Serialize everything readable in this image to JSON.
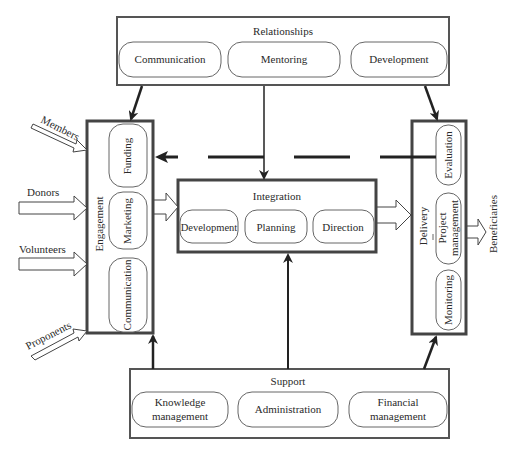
{
  "diagram": {
    "relationships": {
      "title": "Relationships",
      "items": [
        "Communication",
        "Mentoring",
        "Development"
      ]
    },
    "engagement": {
      "title": "Engagement",
      "items": [
        "Funding",
        "Marketing",
        "Communication"
      ]
    },
    "integration": {
      "title": "Integration",
      "items": [
        "Development",
        "Planning",
        "Direction"
      ]
    },
    "delivery": {
      "title": "Delivery",
      "items": [
        "Evaluation",
        "Project",
        "management",
        "Monitoring"
      ]
    },
    "support": {
      "title": "Support",
      "items": [
        "Knowledge",
        "management",
        "Administration",
        "Financial",
        "management"
      ]
    },
    "inputs": [
      "Members",
      "Donors",
      "Volunteers",
      "Proponents"
    ],
    "output": "Beneficiaries",
    "colors": {
      "line": "#333333",
      "box_border": "#444444",
      "background": "#ffffff"
    }
  }
}
